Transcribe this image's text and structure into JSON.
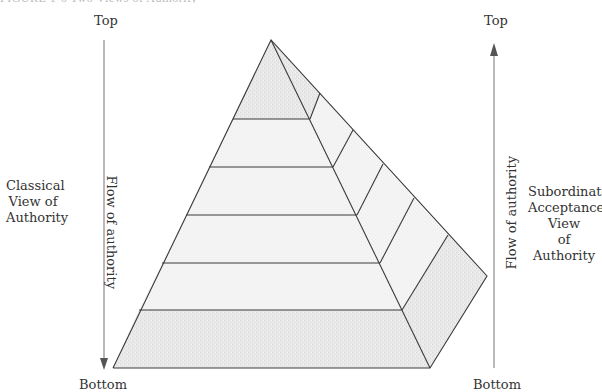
{
  "figure": {
    "caption": "FIGURE 1-6 Two Views of Authority"
  },
  "left_axis": {
    "top_label": "Top",
    "bottom_label": "Bottom",
    "flow_label": "Flow of authority",
    "direction": "down"
  },
  "right_axis": {
    "top_label": "Top",
    "bottom_label": "Bottom",
    "flow_label": "Flow of authority",
    "direction": "up"
  },
  "left_view": {
    "lines": [
      "Classical",
      "View of",
      "Authority"
    ]
  },
  "right_view": {
    "lines": [
      "Subordinate",
      "Acceptance",
      "View",
      "of",
      "Authority"
    ]
  },
  "pyramid": {
    "tiers": 6,
    "colors": {
      "stroke": "#3a3a3a",
      "shade_dark": "#e4e4e4",
      "shade_light": "#f3f3f3",
      "arrow": "#888888"
    }
  }
}
